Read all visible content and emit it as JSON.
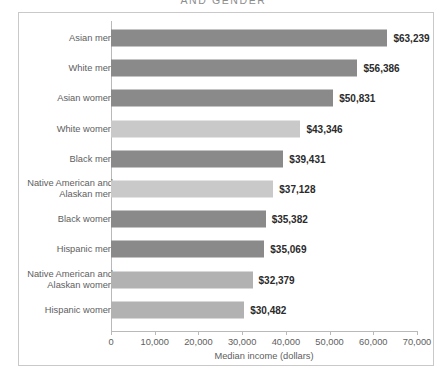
{
  "chart_title": "AND GENDER",
  "axis_title": "Median income (dollars)",
  "chart_data": {
    "type": "bar",
    "orientation": "horizontal",
    "title": "AND GENDER",
    "xlabel": "Median income (dollars)",
    "ylabel": "",
    "xlim": [
      0,
      70000
    ],
    "grid": false,
    "legend": "none",
    "tick_labels": [
      "0",
      "10,000",
      "20,000",
      "30,000",
      "40,000",
      "50,000",
      "60,000",
      "70,000"
    ],
    "tick_values": [
      0,
      10000,
      20000,
      30000,
      40000,
      50000,
      60000,
      70000
    ],
    "categories": [
      "Asian men",
      "White men",
      "Asian women",
      "White women",
      "Black men",
      "Native American and\nAlaskan men",
      "Black women",
      "Hispanic men",
      "Native American and\nAlaskan women",
      "Hispanic women"
    ],
    "values": [
      63239,
      56386,
      50831,
      43346,
      39431,
      37128,
      35382,
      35069,
      32379,
      30482
    ],
    "value_labels": [
      "$63,239",
      "$56,386",
      "$50,831",
      "$43,346",
      "$39,431",
      "$37,128",
      "$35,382",
      "$35,069",
      "$32,379",
      "$30,482"
    ],
    "bar_colors": [
      "#8a8a8a",
      "#8a8a8a",
      "#8a8a8a",
      "#c9c9c9",
      "#8a8a8a",
      "#c9c9c9",
      "#8a8a8a",
      "#8a8a8a",
      "#b2b2b2",
      "#b2b2b2"
    ]
  },
  "colors": {
    "frame_border": "#c9c9c9",
    "axis": "#b9b9b9",
    "label_text": "#5e5e5e",
    "value_text": "#2b2b2b",
    "title_text": "#8d8d8d",
    "background": "#ffffff"
  }
}
